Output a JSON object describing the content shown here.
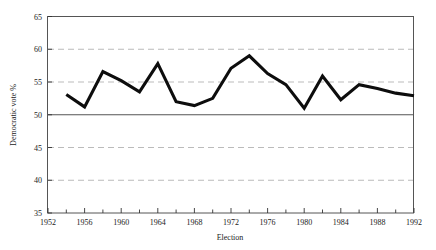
{
  "chart_data": {
    "type": "line",
    "title": "",
    "xlabel": "Election",
    "ylabel": "Democratic vote %",
    "xlim": [
      1952,
      1992
    ],
    "ylim": [
      35,
      65
    ],
    "grid": true,
    "gridlines_y": [
      60,
      55,
      45,
      40
    ],
    "reference_line_y": 50,
    "legend": "none",
    "x_ticks": [
      1952,
      1954,
      1956,
      1958,
      1960,
      1962,
      1964,
      1966,
      1968,
      1970,
      1972,
      1974,
      1976,
      1978,
      1980,
      1982,
      1984,
      1986,
      1988,
      1990,
      1992
    ],
    "x_tick_labels": [
      "1952",
      "",
      "1956",
      "",
      "1960",
      "",
      "1964",
      "",
      "1968",
      "",
      "1972",
      "",
      "1976",
      "",
      "1980",
      "",
      "1984",
      "",
      "1988",
      "",
      "1992"
    ],
    "y_ticks": [
      35,
      40,
      45,
      50,
      55,
      60,
      65
    ],
    "y_tick_labels": [
      "35",
      "40",
      "45",
      "50",
      "55",
      "60",
      "65"
    ],
    "series": [
      {
        "name": "Democratic vote %",
        "color": "#0d0d0d",
        "x": [
          1954,
          1956,
          1958,
          1960,
          1962,
          1964,
          1966,
          1968,
          1970,
          1972,
          1974,
          1976,
          1978,
          1980,
          1982,
          1984,
          1986,
          1988,
          1990,
          1992
        ],
        "values": [
          53.1,
          51.2,
          56.6,
          55.2,
          53.5,
          57.8,
          52.0,
          51.4,
          52.5,
          57.1,
          59.0,
          56.3,
          54.6,
          51.0,
          55.9,
          52.3,
          54.6,
          54.0,
          53.3,
          52.9
        ]
      }
    ]
  },
  "axes": {
    "x_axis_name": "Election",
    "y_axis_name": "Democratic vote %"
  },
  "footer": {
    "cut_text": ""
  }
}
